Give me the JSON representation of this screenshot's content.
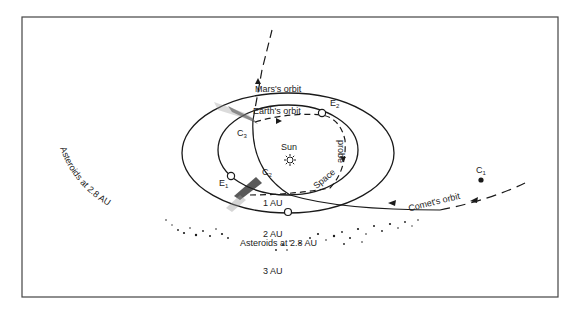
{
  "diagram": {
    "labels": {
      "mars_orbit": "Mars's orbit",
      "earth_orbit": "Earth's orbit",
      "sun": "Sun",
      "space_probe_1": "Space",
      "space_probe_2": "probe",
      "comet_orbit": "Comet's orbit",
      "au1": "1 AU",
      "au2": "2 AU",
      "au3": "3 AU",
      "asteroids_curved": "Asteroids at 2.8 AU",
      "asteroids_belt": "Asteroids at 2.8 AU",
      "c1": "C",
      "c1_sub": "1",
      "c2": "C",
      "c2_sub": "2",
      "c3": "C",
      "c3_sub": "3",
      "e1": "E",
      "e1_sub": "1",
      "e2": "E",
      "e2_sub": "2"
    },
    "colors": {
      "line": "#1a1a1a",
      "frame": "#444444",
      "background": "#ffffff"
    }
  }
}
